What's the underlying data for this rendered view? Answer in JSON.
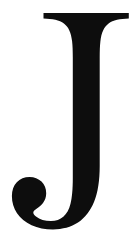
{
  "image": {
    "kind": "glyph-image",
    "description": "Serif capital letter J",
    "character": "J",
    "alt_text": "J",
    "width_px": 138,
    "height_px": 242
  },
  "colors": {
    "background": "#ffffff",
    "ink": "#0d0d0d"
  },
  "glyph": {
    "character": "J",
    "style": "serif",
    "weight": "regular",
    "case": "uppercase",
    "parts": [
      {
        "name": "top-serif",
        "label": "Top serif bar"
      },
      {
        "name": "stem",
        "label": "Vertical stem"
      },
      {
        "name": "hook",
        "label": "Descending hook"
      },
      {
        "name": "terminal",
        "label": "Rounded ball terminal"
      },
      {
        "name": "counter",
        "label": "Counter inside hook"
      }
    ],
    "metrics": {
      "serif_left_x": 43,
      "serif_right_x": 129,
      "serif_top_y": 13,
      "stem_left_x": 57,
      "stem_right_x": 110,
      "hook_bottom_y": 228,
      "terminal_left_x": 17
    },
    "outline_path": "M 43.5 13.0 L 128.8 13.0 L 128.8 18.6 C 120.0 18.9 113.0 20.2 108.6 23.4 C 104.0 26.8 101.4 32.6 100.4 41.2 C 99.9 45.6 99.7 51.0 99.7 57.6 L 99.7 166.0 C 99.7 180.6 97.9 192.4 94.2 201.6 C 90.4 211.0 85.0 218.0 78.0 222.6 C 71.0 227.2 62.6 229.4 53.0 229.4 C 45.0 229.4 37.8 228.0 31.6 225.2 C 25.3 222.3 20.4 218.3 17.0 213.2 C 13.6 208.1 11.9 202.3 11.9 196.0 C 11.9 190.4 13.5 185.8 16.8 182.3 C 20.1 178.7 24.4 176.9 29.6 176.9 C 34.4 176.9 38.4 178.5 41.5 181.6 C 44.6 184.7 46.2 188.6 46.2 193.2 C 46.2 196.9 45.1 200.2 43.0 203.0 C 41.5 205.0 39.2 207.0 36.2 209.0 C 34.3 210.3 33.3 211.4 33.3 212.4 C 33.3 213.6 34.2 214.9 36.0 216.4 C 39.8 219.5 44.8 221.0 51.0 221.0 C 56.0 221.0 60.1 219.6 63.3 216.8 C 66.6 214.0 69.0 209.7 70.5 203.8 C 72.0 198.0 72.8 189.4 72.8 178.0 L 72.8 57.6 C 72.8 51.0 72.6 45.6 72.1 41.2 C 71.1 32.6 68.5 26.8 63.9 23.4 C 59.5 20.2 52.5 18.9 43.5 18.6 Z"
  }
}
